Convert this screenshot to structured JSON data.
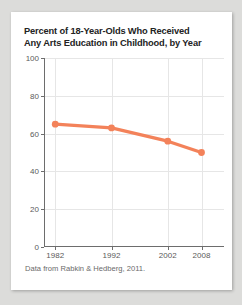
{
  "card": {
    "title_line1": "Percent of 18-Year-Olds Who Received",
    "title_line2": "Any Arts Education in Childhood, by Year",
    "caption": "Data from Rabkin & Hedberg, 2011."
  },
  "chart_data": {
    "type": "line",
    "title": "Percent of 18-Year-Olds Who Received Any Arts Education in Childhood, by Year",
    "xlabel": "",
    "ylabel": "",
    "x": [
      1982,
      1992,
      2002,
      2008
    ],
    "categories": [
      "1982",
      "1992",
      "2002",
      "2008"
    ],
    "values": [
      65,
      63,
      56,
      50
    ],
    "series": [
      {
        "name": "Percent receiving any arts education",
        "values": [
          65,
          63,
          56,
          50
        ]
      }
    ],
    "xlim": [
      1980,
      2012
    ],
    "ylim": [
      0,
      100
    ],
    "ytick_labels": [
      "0",
      "20",
      "40",
      "60",
      "80",
      "100"
    ],
    "ytick_values": [
      0,
      20,
      40,
      60,
      80,
      100
    ],
    "xtick_labels": [
      "1982",
      "1992",
      "2002",
      "2008"
    ],
    "xtick_values": [
      1982,
      1992,
      2002,
      2008
    ],
    "grid": true,
    "legend": "none",
    "line_color": "#f3825a",
    "marker_color": "#f3825a",
    "grid_color": "#e6e6e6",
    "axis_color": "#6d6d6d",
    "annotation": "Data from Rabkin & Hedberg, 2011."
  }
}
